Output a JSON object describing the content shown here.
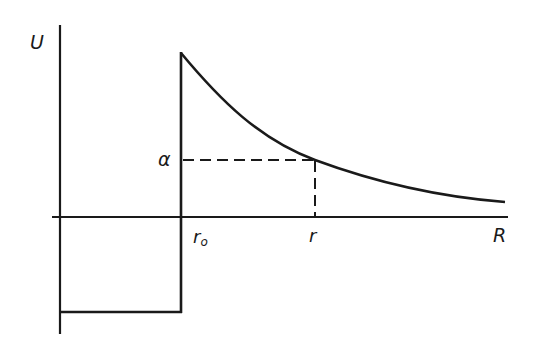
{
  "diagram": {
    "labels": {
      "y_axis": "U",
      "x_axis": "R",
      "alpha": "α",
      "r0_main": "r",
      "r0_sub": "o",
      "r": "r"
    },
    "colors": {
      "ink": "#1a1a1a",
      "background": "#ffffff"
    },
    "geometry": {
      "y_axis_x": 60,
      "y_axis_top": 25,
      "y_axis_bottom": 334,
      "x_axis_y": 217,
      "x_axis_left": 52,
      "x_axis_right": 508,
      "wall_x": 181,
      "wall_top": 53,
      "well_bottom_y": 312,
      "alpha_y": 160,
      "r_x": 315,
      "curve_end_x": 505,
      "curve_end_y": 202
    }
  }
}
